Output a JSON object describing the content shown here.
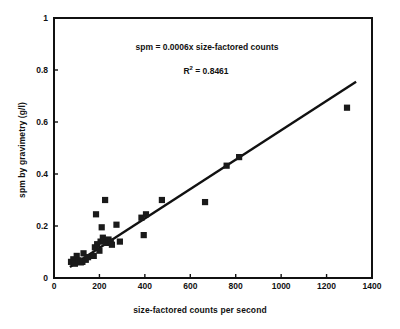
{
  "chart_data": {
    "type": "scatter",
    "title": "",
    "xlabel": "size-factored counts per second",
    "ylabel": "spm by gravimetry (g/l)",
    "xlim": [
      0,
      1400
    ],
    "ylim": [
      0,
      1
    ],
    "xticks": [
      0,
      200,
      400,
      600,
      800,
      1000,
      1200,
      1400
    ],
    "yticks": [
      0,
      0.2,
      0.4,
      0.6,
      0.8,
      1
    ],
    "xtick_labels": [
      "0",
      "200",
      "400",
      "600",
      "800",
      "1000",
      "1200",
      "1400"
    ],
    "ytick_labels": [
      "0",
      "0.2",
      "0.4",
      "0.6",
      "0.8",
      "1"
    ],
    "grid": false,
    "legend": false,
    "marker": "filled-square",
    "marker_color": "#1a1a1a",
    "series": [
      {
        "name": "spm measurements",
        "points": [
          [
            75,
            0.062
          ],
          [
            85,
            0.072
          ],
          [
            92,
            0.055
          ],
          [
            100,
            0.085
          ],
          [
            108,
            0.068
          ],
          [
            118,
            0.06
          ],
          [
            125,
            0.062
          ],
          [
            130,
            0.095
          ],
          [
            140,
            0.07
          ],
          [
            150,
            0.08
          ],
          [
            175,
            0.085
          ],
          [
            180,
            0.118
          ],
          [
            185,
            0.245
          ],
          [
            190,
            0.13
          ],
          [
            200,
            0.105
          ],
          [
            205,
            0.14
          ],
          [
            210,
            0.195
          ],
          [
            215,
            0.155
          ],
          [
            220,
            0.145
          ],
          [
            225,
            0.3
          ],
          [
            230,
            0.135
          ],
          [
            240,
            0.148
          ],
          [
            250,
            0.14
          ],
          [
            255,
            0.128
          ],
          [
            275,
            0.205
          ],
          [
            290,
            0.14
          ],
          [
            385,
            0.232
          ],
          [
            395,
            0.165
          ],
          [
            405,
            0.245
          ],
          [
            475,
            0.3
          ],
          [
            665,
            0.292
          ],
          [
            760,
            0.432
          ],
          [
            815,
            0.465
          ],
          [
            1290,
            0.655
          ]
        ]
      }
    ],
    "trendline": {
      "equation_text": "spm = 0.0006x size-factored counts",
      "r2_label": "R",
      "r2_superscript": "2",
      "r2_text": " = 0.8461",
      "r2_value": 0.8461,
      "slope": 0.0006,
      "intercept": 0,
      "x_start": 70,
      "y_start": 0.042,
      "x_end": 1330,
      "y_end": 0.755,
      "color": "#111111"
    },
    "axis_color": "#111111"
  }
}
